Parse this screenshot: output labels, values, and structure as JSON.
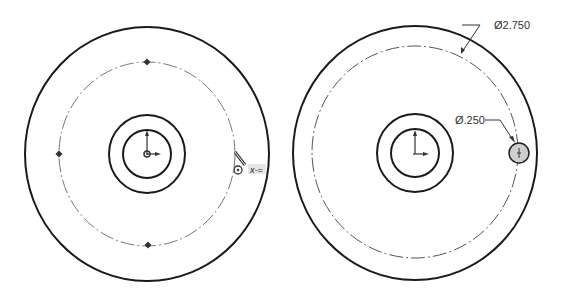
{
  "left_view": {
    "description": "Sketch with construction circle and sketch points",
    "inference_symbol": "x-="
  },
  "right_view": {
    "dimensions": {
      "bolt_circle": "Ø2.750",
      "hole": "Ø.250"
    }
  },
  "colors": {
    "line": "#1a1a1a",
    "construction": "#777777",
    "hole_fill": "#cfcfcf"
  }
}
